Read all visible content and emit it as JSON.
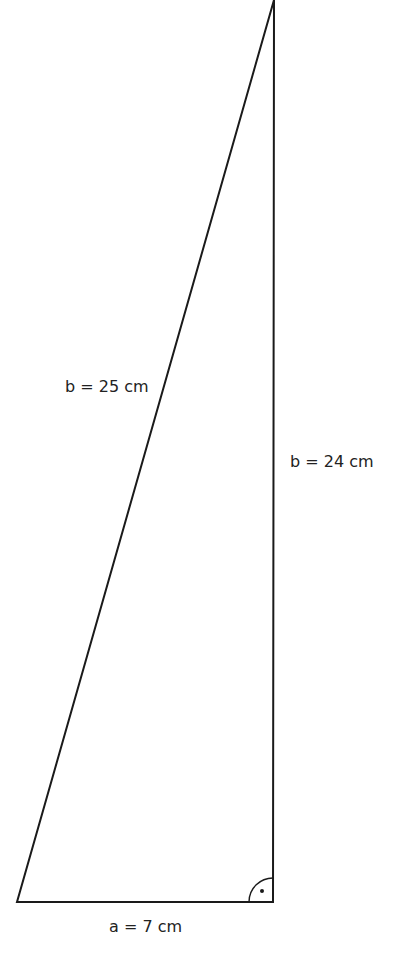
{
  "diagram": {
    "type": "right-triangle",
    "stroke_color": "#1a1a1a",
    "vertices": {
      "bottom_left": [
        17,
        902
      ],
      "bottom_right": [
        273,
        902
      ],
      "apex": [
        274,
        0
      ]
    },
    "labels": {
      "hypotenuse": "b = 25 cm",
      "vertical_leg": "b = 24 cm",
      "base": "a = 7 cm"
    },
    "right_angle_marker": {
      "corner": "bottom-right",
      "style": "arc-with-dot"
    }
  }
}
